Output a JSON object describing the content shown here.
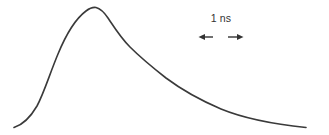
{
  "figure": {
    "background_color": "#ffffff",
    "width": 329,
    "height": 135,
    "curve_color": "#3a3a3a",
    "annotation_color": "#333333",
    "curve_line_width": 1.6
  },
  "annotation": {
    "scale_bar_label": "1 ns",
    "left_arrow_name": "left-arrow",
    "right_arrow_name": "right-arrow",
    "left_arrow_x1": 199,
    "left_arrow_x2": 213,
    "right_arrow_x1": 228,
    "right_arrow_x2": 243,
    "arrow_y": 37
  },
  "chart_data": {
    "type": "line",
    "title": "",
    "subtitle": "",
    "xlabel": "",
    "ylabel": "",
    "grid": false,
    "legend": false,
    "axes_visible": false,
    "annotations": [
      {
        "text": "1 ns",
        "kind": "scale-bar",
        "x_start": 199,
        "x_end": 243,
        "y": 37,
        "label_x": 221,
        "label_y": 22
      }
    ],
    "series": [
      {
        "name": "decay-curve",
        "color": "#3a3a3a",
        "points_px": [
          [
            14,
            127
          ],
          [
            20,
            124
          ],
          [
            26,
            119
          ],
          [
            31,
            113
          ],
          [
            37,
            105
          ],
          [
            43,
            92
          ],
          [
            49,
            76
          ],
          [
            55,
            60
          ],
          [
            61,
            45
          ],
          [
            67,
            33
          ],
          [
            73,
            24
          ],
          [
            79,
            16
          ],
          [
            85,
            11
          ],
          [
            90,
            8
          ],
          [
            95,
            7
          ],
          [
            100,
            9
          ],
          [
            106,
            14
          ],
          [
            112,
            22
          ],
          [
            118,
            31
          ],
          [
            124,
            39
          ],
          [
            130,
            46
          ],
          [
            137,
            54
          ],
          [
            144,
            60
          ],
          [
            151,
            66
          ],
          [
            159,
            72
          ],
          [
            167,
            78
          ],
          [
            175,
            84
          ],
          [
            183,
            89
          ],
          [
            191,
            94
          ],
          [
            199,
            98
          ],
          [
            208,
            103
          ],
          [
            217,
            107
          ],
          [
            226,
            111
          ],
          [
            235,
            114
          ],
          [
            245,
            117
          ],
          [
            255,
            120
          ],
          [
            265,
            122
          ],
          [
            275,
            124
          ],
          [
            285,
            125
          ],
          [
            295,
            126
          ],
          [
            305,
            127
          ]
        ],
        "path_d": "M 14 127.5 C 22 125 30 118 37 106 C 44 93 50 73 58 54 C 65 37 74 20 86 11 C 90 8 93 7 96 7.5 C 100 8.5 104 12 108 18 C 114 27 121 38 130 47 C 140 57 152 67 166 78 C 182 90 200 100 221 109 C 243 118 272 124 306 127.5"
      }
    ],
    "axis_ranges": {
      "x_px": [
        0,
        329
      ],
      "y_px": [
        0,
        135
      ]
    }
  }
}
